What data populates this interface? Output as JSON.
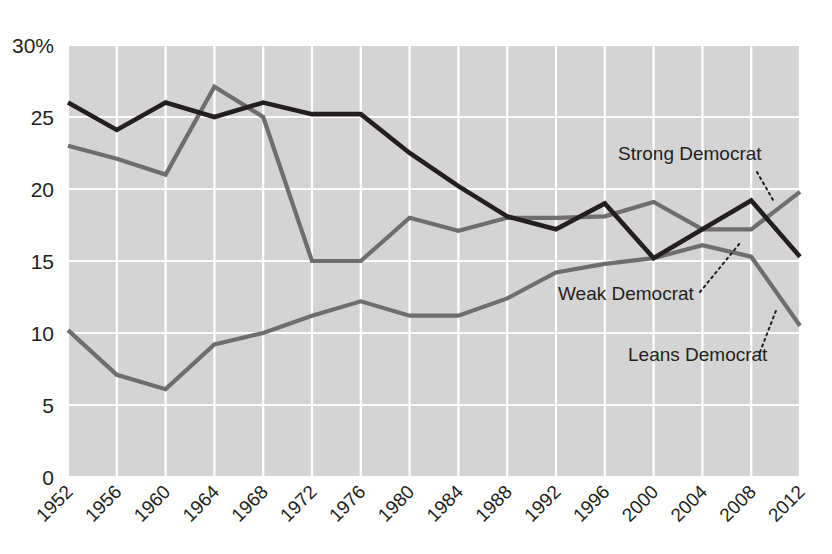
{
  "chart_data": {
    "type": "line",
    "title": "",
    "subtitle": "",
    "xlabel": "",
    "ylabel": "",
    "grid": true,
    "legend_position": "inline-annotations",
    "categories": [
      "1952",
      "1956",
      "1960",
      "1964",
      "1968",
      "1972",
      "1976",
      "1980",
      "1984",
      "1988",
      "1992",
      "1996",
      "2000",
      "2004",
      "2008",
      "2012"
    ],
    "x": [
      1952,
      1956,
      1960,
      1964,
      1968,
      1972,
      1976,
      1980,
      1984,
      1988,
      1992,
      1996,
      2000,
      2004,
      2008,
      2012
    ],
    "xlim": [
      1952,
      2012
    ],
    "ylim": [
      0,
      30
    ],
    "yticks": [
      0,
      5,
      10,
      15,
      20,
      25,
      30
    ],
    "ytick_labels": [
      "0",
      "5",
      "10",
      "15",
      "20",
      "25",
      "30%"
    ],
    "series": [
      {
        "name": "Strong Democrat",
        "color": "#231f20",
        "width": 4.6,
        "values": [
          26.0,
          24.1,
          26.0,
          25.0,
          26.0,
          25.2,
          25.2,
          22.5,
          20.2,
          18.1,
          17.2,
          19.0,
          15.2,
          17.2,
          19.2,
          15.3
        ]
      },
      {
        "name": "Weak Democrat",
        "color": "#6e6e6e",
        "width": 4.2,
        "values": [
          23.0,
          22.1,
          21.0,
          27.1,
          25.0,
          15.0,
          15.0,
          18.0,
          17.1,
          18.0,
          18.0,
          18.1,
          19.1,
          17.2,
          17.2,
          19.8
        ]
      },
      {
        "name": "Leans Democrat",
        "color": "#6e6e6e",
        "width": 4.2,
        "values": [
          10.2,
          7.1,
          6.1,
          9.2,
          10.0,
          11.2,
          12.2,
          11.2,
          11.2,
          12.4,
          14.2,
          14.8,
          15.2,
          16.1,
          15.3,
          10.5
        ]
      }
    ],
    "annotations": [
      {
        "id": "strong-democrat",
        "label": "Strong Democrat",
        "text_x": 618,
        "text_y": 160,
        "leader": [
          [
            757,
            172
          ],
          [
            773,
            200
          ]
        ]
      },
      {
        "id": "weak-democrat",
        "label": "Weak Democrat",
        "text_x": 558,
        "text_y": 300,
        "leader": [
          [
            700,
            292
          ],
          [
            740,
            243
          ]
        ]
      },
      {
        "id": "leans-democrat",
        "label": "Leans Democrat",
        "text_x": 628,
        "text_y": 361,
        "leader": [
          [
            760,
            352
          ],
          [
            777,
            308
          ]
        ]
      }
    ],
    "plot_area": {
      "left": 68,
      "top": 45,
      "right": 800,
      "bottom": 477,
      "background": "#d4d4d4",
      "gridline_color": "#ffffff"
    }
  }
}
